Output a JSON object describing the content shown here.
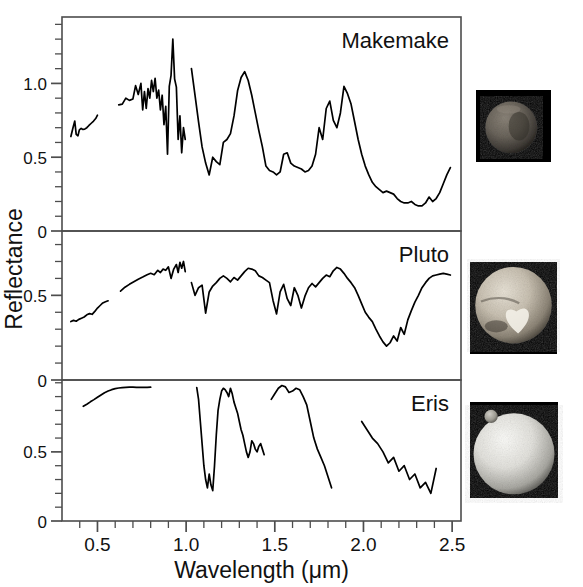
{
  "figure": {
    "axis_labels": {
      "x": "Wavelength (μm)",
      "y": "Reflectance"
    },
    "x_axis": {
      "min": 0.3,
      "max": 2.55,
      "major_ticks": [
        0.5,
        1.0,
        1.5,
        2.0,
        2.5
      ],
      "major_tick_labels": [
        "0.5",
        "1.0",
        "1.5",
        "2.0",
        "2.5"
      ],
      "minor_tick_step": 0.1
    },
    "panels": [
      {
        "name": "Makemake",
        "label": "Makemake",
        "ylim": [
          0.0,
          1.45
        ],
        "y_ticks": [
          0.0,
          0.5,
          1.0
        ],
        "y_tick_labels": [
          "0",
          "0.5",
          "1.0"
        ],
        "y_minor_step": 0.1,
        "thumbnail": {
          "name": "makemake-thumbnail",
          "alt": "Makemake disk",
          "brightness": "dim",
          "moon": false
        }
      },
      {
        "name": "Pluto",
        "label": "Pluto",
        "ylim": [
          0.0,
          0.88
        ],
        "y_ticks": [
          0.0,
          0.5
        ],
        "y_tick_labels": [
          "0",
          "0.5"
        ],
        "y_minor_step": 0.1,
        "thumbnail": {
          "name": "pluto-thumbnail",
          "alt": "Pluto disk with heart-shaped Tombaugh Regio",
          "brightness": "bright",
          "moon": false
        }
      },
      {
        "name": "Eris",
        "label": "Eris",
        "ylim": [
          0.0,
          1.02
        ],
        "y_ticks": [
          0.0,
          0.5
        ],
        "y_tick_labels": [
          "0",
          "0.5"
        ],
        "y_minor_step": 0.1,
        "thumbnail": {
          "name": "eris-thumbnail",
          "alt": "Eris disk with moon Dysnomia",
          "brightness": "very-bright",
          "moon": true
        }
      }
    ],
    "colors": {
      "curve": "#000000",
      "frame": "#4d4d4d",
      "text": "#111111",
      "background": "#ffffff",
      "thumb_background": "#000000"
    }
  },
  "chart_data": {
    "type": "line",
    "title": "",
    "xlabel": "Wavelength (μm)",
    "ylabel": "Reflectance",
    "grid": false,
    "legend": "none",
    "xlim": [
      0.3,
      2.55
    ],
    "panels": [
      {
        "name": "Makemake",
        "ylim": [
          0.0,
          1.45
        ],
        "segments": [
          {
            "range": "visible",
            "x": [
              0.35,
              0.362,
              0.372,
              0.38,
              0.39,
              0.398,
              0.408,
              0.418,
              0.428,
              0.44,
              0.452,
              0.465,
              0.478,
              0.49,
              0.5
            ],
            "y": [
              0.64,
              0.7,
              0.745,
              0.655,
              0.645,
              0.685,
              0.695,
              0.688,
              0.69,
              0.7,
              0.715,
              0.73,
              0.745,
              0.762,
              0.785
            ]
          },
          {
            "range": "near-infrared-1",
            "x": [
              0.62,
              0.64,
              0.66,
              0.68,
              0.7,
              0.715,
              0.73,
              0.745,
              0.755,
              0.765,
              0.775,
              0.785,
              0.795,
              0.805,
              0.815,
              0.825,
              0.835,
              0.845,
              0.855,
              0.865,
              0.875,
              0.885,
              0.895,
              0.905,
              0.915,
              0.925,
              0.935,
              0.945,
              0.955,
              0.965,
              0.975,
              0.985,
              0.995
            ],
            "y": [
              0.855,
              0.86,
              0.9,
              0.885,
              0.895,
              0.985,
              0.925,
              1.0,
              0.82,
              0.945,
              0.83,
              0.965,
              0.9,
              1.02,
              0.945,
              1.035,
              0.9,
              0.955,
              0.82,
              0.92,
              0.72,
              0.845,
              0.52,
              0.98,
              1.055,
              1.3,
              1.03,
              0.975,
              0.62,
              0.78,
              0.53,
              0.7,
              0.62
            ]
          },
          {
            "range": "near-infrared-2",
            "x": [
              1.03,
              1.05,
              1.07,
              1.09,
              1.11,
              1.13,
              1.15,
              1.17,
              1.19,
              1.21,
              1.23,
              1.25,
              1.27,
              1.29,
              1.31,
              1.33,
              1.35,
              1.37,
              1.39,
              1.41,
              1.43,
              1.45,
              1.47,
              1.49,
              1.51,
              1.53,
              1.55,
              1.57,
              1.59,
              1.61,
              1.63,
              1.65,
              1.67,
              1.69,
              1.71,
              1.73,
              1.75,
              1.77,
              1.79,
              1.81,
              1.83,
              1.85,
              1.87,
              1.89,
              1.91,
              1.93,
              1.95,
              1.97,
              1.99,
              2.01,
              2.03,
              2.05,
              2.07,
              2.09,
              2.11,
              2.13,
              2.15,
              2.17,
              2.19,
              2.21,
              2.23,
              2.25,
              2.27,
              2.29,
              2.31,
              2.33,
              2.35,
              2.37,
              2.39,
              2.41,
              2.43,
              2.45,
              2.47,
              2.49
            ],
            "y": [
              1.1,
              0.92,
              0.74,
              0.57,
              0.46,
              0.38,
              0.5,
              0.47,
              0.45,
              0.6,
              0.62,
              0.66,
              0.78,
              0.95,
              1.04,
              1.08,
              1.02,
              0.92,
              0.8,
              0.68,
              0.57,
              0.44,
              0.41,
              0.4,
              0.38,
              0.4,
              0.52,
              0.53,
              0.46,
              0.44,
              0.43,
              0.42,
              0.4,
              0.41,
              0.44,
              0.52,
              0.7,
              0.62,
              0.83,
              0.88,
              0.75,
              0.7,
              0.8,
              0.98,
              0.93,
              0.86,
              0.74,
              0.62,
              0.52,
              0.44,
              0.38,
              0.33,
              0.3,
              0.28,
              0.26,
              0.27,
              0.26,
              0.25,
              0.22,
              0.2,
              0.19,
              0.19,
              0.2,
              0.18,
              0.17,
              0.17,
              0.19,
              0.23,
              0.2,
              0.22,
              0.26,
              0.32,
              0.38,
              0.43
            ]
          }
        ]
      },
      {
        "name": "Pluto",
        "ylim": [
          0.0,
          0.88
        ],
        "segments": [
          {
            "range": "visible",
            "x": [
              0.35,
              0.365,
              0.38,
              0.395,
              0.41,
              0.425,
              0.44,
              0.455,
              0.47,
              0.485,
              0.5,
              0.515,
              0.53,
              0.545,
              0.56
            ],
            "y": [
              0.345,
              0.352,
              0.347,
              0.358,
              0.365,
              0.372,
              0.385,
              0.392,
              0.388,
              0.405,
              0.425,
              0.44,
              0.455,
              0.462,
              0.468
            ]
          },
          {
            "range": "near-infrared-1",
            "x": [
              0.63,
              0.655,
              0.68,
              0.705,
              0.73,
              0.755,
              0.78,
              0.8,
              0.82,
              0.84,
              0.855,
              0.87,
              0.885,
              0.9,
              0.915,
              0.93,
              0.945,
              0.955,
              0.965,
              0.975,
              0.985,
              0.995
            ],
            "y": [
              0.525,
              0.548,
              0.565,
              0.58,
              0.595,
              0.608,
              0.622,
              0.63,
              0.622,
              0.648,
              0.635,
              0.655,
              0.648,
              0.668,
              0.6,
              0.655,
              0.682,
              0.635,
              0.695,
              0.66,
              0.7,
              0.64
            ]
          },
          {
            "range": "near-infrared-2",
            "x": [
              1.03,
              1.05,
              1.07,
              1.09,
              1.11,
              1.13,
              1.15,
              1.17,
              1.19,
              1.21,
              1.23,
              1.25,
              1.27,
              1.29,
              1.31,
              1.33,
              1.35,
              1.37,
              1.39,
              1.41,
              1.43,
              1.45,
              1.47,
              1.49,
              1.51,
              1.53,
              1.55,
              1.57,
              1.59,
              1.61,
              1.63,
              1.65,
              1.67,
              1.69,
              1.71,
              1.73,
              1.75,
              1.77,
              1.79,
              1.81,
              1.83,
              1.85,
              1.87,
              1.89,
              1.91,
              1.93,
              1.95,
              1.97,
              1.99,
              2.01,
              2.03,
              2.05,
              2.07,
              2.09,
              2.11,
              2.13,
              2.15,
              2.17,
              2.19,
              2.21,
              2.23,
              2.25,
              2.27,
              2.29,
              2.31,
              2.33,
              2.35,
              2.37,
              2.39,
              2.41,
              2.43,
              2.45,
              2.47,
              2.49
            ],
            "y": [
              0.575,
              0.5,
              0.545,
              0.56,
              0.395,
              0.52,
              0.555,
              0.575,
              0.6,
              0.615,
              0.6,
              0.58,
              0.605,
              0.59,
              0.615,
              0.64,
              0.66,
              0.655,
              0.645,
              0.615,
              0.605,
              0.59,
              0.575,
              0.47,
              0.39,
              0.52,
              0.565,
              0.48,
              0.44,
              0.545,
              0.5,
              0.425,
              0.495,
              0.545,
              0.57,
              0.55,
              0.575,
              0.6,
              0.62,
              0.61,
              0.645,
              0.665,
              0.655,
              0.63,
              0.6,
              0.575,
              0.545,
              0.5,
              0.45,
              0.4,
              0.37,
              0.345,
              0.3,
              0.26,
              0.225,
              0.2,
              0.22,
              0.26,
              0.23,
              0.31,
              0.27,
              0.355,
              0.41,
              0.46,
              0.5,
              0.545,
              0.575,
              0.6,
              0.615,
              0.62,
              0.625,
              0.63,
              0.625,
              0.62
            ]
          }
        ]
      },
      {
        "name": "Eris",
        "ylim": [
          0.0,
          1.02
        ],
        "segments": [
          {
            "range": "visible",
            "x": [
              0.42,
              0.44,
              0.46,
              0.48,
              0.5,
              0.52,
              0.54,
              0.56,
              0.58,
              0.6,
              0.62,
              0.64,
              0.66,
              0.68,
              0.7,
              0.72,
              0.74,
              0.76,
              0.78,
              0.8
            ],
            "y": [
              0.83,
              0.845,
              0.862,
              0.878,
              0.895,
              0.912,
              0.928,
              0.94,
              0.95,
              0.958,
              0.962,
              0.965,
              0.967,
              0.968,
              0.968,
              0.967,
              0.966,
              0.966,
              0.967,
              0.968
            ]
          },
          {
            "range": "near-infrared-1",
            "x": [
              1.06,
              1.07,
              1.08,
              1.09,
              1.1,
              1.11,
              1.12,
              1.13,
              1.14,
              1.15,
              1.16,
              1.17,
              1.18,
              1.19,
              1.2,
              1.21,
              1.22,
              1.23,
              1.24,
              1.25,
              1.26,
              1.27,
              1.28,
              1.29,
              1.3,
              1.31,
              1.32,
              1.33,
              1.34,
              1.35,
              1.36,
              1.37,
              1.38,
              1.39,
              1.4,
              1.41,
              1.42,
              1.43,
              1.44
            ],
            "y": [
              0.965,
              0.88,
              0.72,
              0.56,
              0.4,
              0.3,
              0.24,
              0.34,
              0.26,
              0.22,
              0.4,
              0.62,
              0.8,
              0.88,
              0.94,
              0.96,
              0.95,
              0.93,
              0.9,
              0.96,
              0.92,
              0.86,
              0.82,
              0.78,
              0.72,
              0.66,
              0.62,
              0.56,
              0.5,
              0.46,
              0.5,
              0.58,
              0.56,
              0.52,
              0.5,
              0.54,
              0.56,
              0.52,
              0.48
            ]
          },
          {
            "range": "near-infrared-2",
            "x": [
              1.48,
              1.5,
              1.52,
              1.54,
              1.56,
              1.58,
              1.6,
              1.62,
              1.64,
              1.66,
              1.68,
              1.7,
              1.72,
              1.74,
              1.76,
              1.78,
              1.8,
              1.82
            ],
            "y": [
              0.88,
              0.92,
              0.96,
              0.98,
              0.97,
              0.93,
              0.94,
              0.96,
              0.95,
              0.9,
              0.84,
              0.72,
              0.6,
              0.52,
              0.46,
              0.4,
              0.32,
              0.24
            ]
          },
          {
            "range": "near-infrared-3",
            "x": [
              1.99,
              2.02,
              2.05,
              2.08,
              2.11,
              2.14,
              2.17,
              2.2,
              2.23,
              2.26,
              2.29,
              2.32,
              2.35,
              2.38,
              2.41
            ],
            "y": [
              0.72,
              0.66,
              0.6,
              0.56,
              0.5,
              0.42,
              0.46,
              0.36,
              0.4,
              0.3,
              0.34,
              0.24,
              0.28,
              0.2,
              0.38
            ]
          }
        ]
      }
    ]
  }
}
